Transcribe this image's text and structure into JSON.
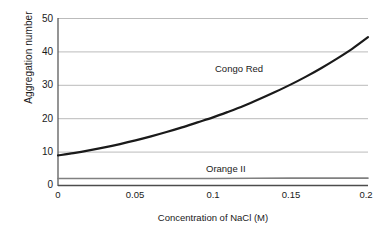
{
  "chart_data": {
    "type": "line",
    "title": "",
    "xlabel": "Concentration of NaCl (M)",
    "ylabel": "Aggregation number",
    "xlim": [
      0,
      0.2
    ],
    "ylim": [
      0,
      50
    ],
    "xticks": [
      "0",
      "0.05",
      "0.1",
      "0.15",
      "0.2"
    ],
    "xtick_values": [
      0,
      0.05,
      0.1,
      0.15,
      0.2
    ],
    "yticks": [
      "0",
      "10",
      "20",
      "30",
      "40",
      "50"
    ],
    "ytick_values": [
      0,
      10,
      20,
      30,
      40,
      50
    ],
    "grid": "horizontal",
    "legend_position": "inline-annotation",
    "series": [
      {
        "name": "Congo Red",
        "color": "#1a1a1a",
        "line_width": 2.2,
        "x": [
          0.0,
          0.01,
          0.02,
          0.03,
          0.04,
          0.05,
          0.06,
          0.07,
          0.08,
          0.09,
          0.1,
          0.11,
          0.12,
          0.13,
          0.14,
          0.15,
          0.16,
          0.17,
          0.18,
          0.19,
          0.2
        ],
        "values": [
          9.0,
          9.7,
          10.5,
          11.4,
          12.4,
          13.5,
          14.7,
          16.0,
          17.4,
          18.9,
          20.4,
          22.1,
          23.9,
          25.9,
          28.0,
          30.2,
          32.6,
          35.2,
          38.0,
          41.0,
          44.4
        ]
      },
      {
        "name": "Orange II",
        "color": "#808080",
        "line_width": 1.6,
        "x": [
          0.0,
          0.05,
          0.1,
          0.15,
          0.2
        ],
        "values": [
          2.1,
          2.1,
          2.1,
          2.2,
          2.2
        ]
      }
    ],
    "annotations": [
      {
        "text": "Congo Red",
        "series": "Congo Red"
      },
      {
        "text": "Orange II",
        "series": "Orange II"
      }
    ],
    "colors": {
      "axis": "#4d4d4d",
      "grid": "#b3b3b3",
      "text": "#1a1a1a",
      "background": "#ffffff",
      "congo_red_line": "#1a1a1a",
      "orange_ii_line": "#808080"
    }
  }
}
